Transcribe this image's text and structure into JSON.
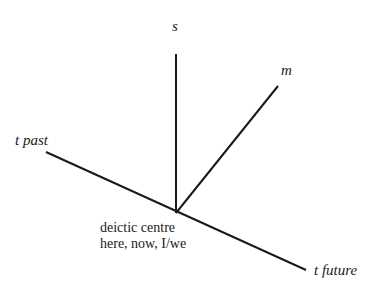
{
  "diagram": {
    "type": "deictic-axes",
    "line_color": "#1a1a1a",
    "vertex": {
      "x": 176,
      "y": 213
    },
    "axes": [
      {
        "id": "s",
        "label": "s",
        "end": {
          "x": 176,
          "y": 54
        }
      },
      {
        "id": "m",
        "label": "m",
        "end": {
          "x": 278,
          "y": 86
        }
      },
      {
        "id": "t_past",
        "label": "t past",
        "end": {
          "x": 46,
          "y": 152
        }
      },
      {
        "id": "t_future",
        "label": "t future",
        "end": {
          "x": 306,
          "y": 270
        }
      }
    ],
    "centre": {
      "line1": "deictic centre",
      "line2": "here, now, I/we"
    }
  }
}
